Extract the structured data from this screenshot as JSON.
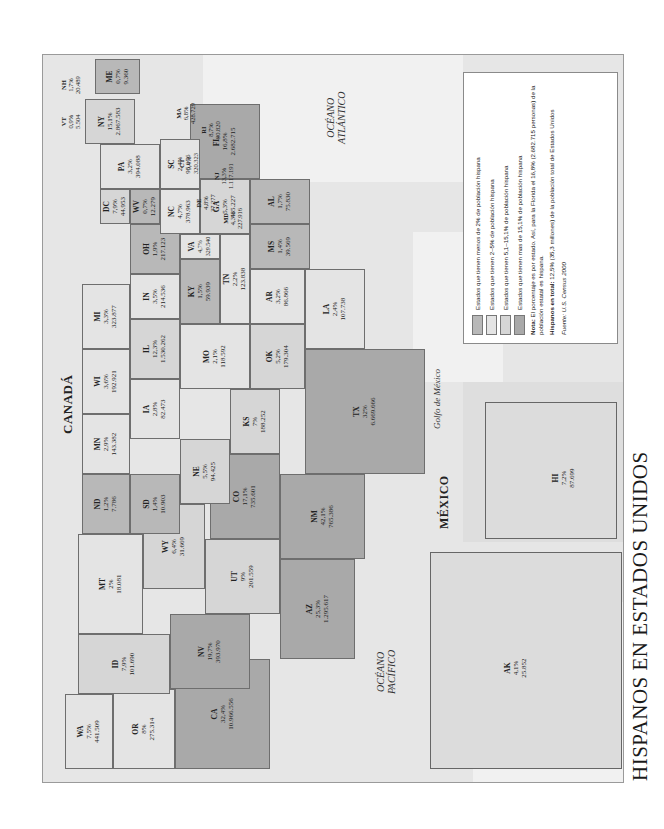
{
  "title": "HISPANOS EN ESTADOS UNIDOS",
  "place_labels": {
    "canada": "CANADÁ",
    "mexico": "MÉXICO",
    "atlantic": [
      "OCÉANO",
      "ATLÁNTICO"
    ],
    "pacific": [
      "OCÉANO",
      "PACÍFICO"
    ],
    "gulf": "Golfo de México"
  },
  "legend": {
    "items": [
      {
        "label": "Estados que tienen menos de 2% de población hispana",
        "color": "#b8b8b8"
      },
      {
        "label": "Estados que tienen 2–5% de población hispana",
        "color": "#e4e4e4"
      },
      {
        "label": "Estados que tienen 5,1–15,1% de población hispana",
        "color": "#d6d6d6"
      },
      {
        "label": "Estados que tienen mas de 15,1% de población hispana",
        "color": "#a9a9a9"
      }
    ],
    "note_bold": "Nota:",
    "note": " El porcentaje es por estado. Así, para la Florida el 16,8% (2.682.715 personas) de la población estatal es hispana.",
    "total_bold": "Hispanos en total:",
    "total": " 12,5% (35,3 millones) de la población total de Estados Unidos",
    "source": "Fuente: U.S. Census 2000"
  },
  "states": {
    "WA": {
      "pct": "7,5%",
      "pop": "441.509"
    },
    "OR": {
      "pct": "8%",
      "pop": "275.314"
    },
    "CA": {
      "pct": "32,4%",
      "pop": "10.966.556"
    },
    "ID": {
      "pct": "7,9%",
      "pop": "101.690"
    },
    "NV": {
      "pct": "19,7%",
      "pop": "393.970"
    },
    "MT": {
      "pct": "2%",
      "pop": "18.081"
    },
    "WY": {
      "pct": "6,4%",
      "pop": "31.669"
    },
    "UT": {
      "pct": "9%",
      "pop": "201.559"
    },
    "AZ": {
      "pct": "25,3%",
      "pop": "1.295.617"
    },
    "CO": {
      "pct": "17,1%",
      "pop": "735.601"
    },
    "NM": {
      "pct": "42,1%",
      "pop": "765.386"
    },
    "ND": {
      "pct": "1,2%",
      "pop": "7.786"
    },
    "SD": {
      "pct": "1,4%",
      "pop": "10.903"
    },
    "NE": {
      "pct": "5,5%",
      "pop": "94.425"
    },
    "KS": {
      "pct": "7%",
      "pop": "188.252"
    },
    "OK": {
      "pct": "5,2%",
      "pop": "179.304"
    },
    "TX": {
      "pct": "32%",
      "pop": "6.669.666"
    },
    "MN": {
      "pct": "2,9%",
      "pop": "143.382"
    },
    "IA": {
      "pct": "2,8%",
      "pop": "82.473"
    },
    "MO": {
      "pct": "2,1%",
      "pop": "118.592"
    },
    "AR": {
      "pct": "3,2%",
      "pop": "86.866"
    },
    "LA": {
      "pct": "2,4%",
      "pop": "107.738"
    },
    "WI": {
      "pct": "3,6%",
      "pop": "192.921"
    },
    "IL": {
      "pct": "12,3%",
      "pop": "1.530.262"
    },
    "MI": {
      "pct": "3,3%",
      "pop": "323.877"
    },
    "IN": {
      "pct": "3,5%",
      "pop": "214.536"
    },
    "OH": {
      "pct": "1,9%",
      "pop": "217.123"
    },
    "KY": {
      "pct": "1,5%",
      "pop": "59.939"
    },
    "TN": {
      "pct": "2,2%",
      "pop": "123.838"
    },
    "MS": {
      "pct": "1,4%",
      "pop": "39.569"
    },
    "AL": {
      "pct": "1,7%",
      "pop": "75.830"
    },
    "GA": {
      "pct": "5,3%",
      "pop": "435.227"
    },
    "FL": {
      "pct": "16,8%",
      "pop": "2.682.715"
    },
    "SC": {
      "pct": "2,4%",
      "pop": "95.076"
    },
    "NC": {
      "pct": "4,7%",
      "pop": "378.963"
    },
    "VA": {
      "pct": "4,7%",
      "pop": "329.540"
    },
    "WV": {
      "pct": "0,7%",
      "pop": "12.279"
    },
    "PA": {
      "pct": "3,2%",
      "pop": "394.088"
    },
    "DC": {
      "pct": "7,9%",
      "pop": "44.953"
    },
    "NY": {
      "pct": "15,1%",
      "pop": "2.867.583"
    },
    "MD": {
      "pct": "4,3%",
      "pop": "227.916"
    },
    "DE": {
      "pct": "4,8%",
      "pop": "37.277"
    },
    "NJ": {
      "pct": "13,3%",
      "pop": "1.117.191"
    },
    "CT": {
      "pct": "9,4%",
      "pop": "320.323"
    },
    "RI": {
      "pct": "8,7%",
      "pop": "90.820"
    },
    "MA": {
      "pct": "6,8%",
      "pop": "428.729"
    },
    "VT": {
      "pct": "0,9%",
      "pop": "5.504"
    },
    "NH": {
      "pct": "1,7%",
      "pop": "20.489"
    },
    "ME": {
      "pct": "0,7%",
      "pop": "9.360"
    },
    "AK": {
      "pct": "4,1%",
      "pop": "25.852"
    },
    "HI": {
      "pct": "7,2%",
      "pop": "87.699"
    }
  }
}
